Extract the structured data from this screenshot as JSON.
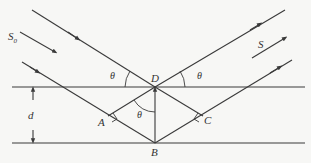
{
  "diagram": {
    "labels": {
      "incident_beam": "S",
      "incident_sub": "0",
      "reflected_beam": "S",
      "point_D": "D",
      "point_A": "A",
      "point_B": "B",
      "point_C": "C",
      "spacing": "d",
      "angle_left": "θ",
      "angle_right": "θ",
      "angle_inner": "θ"
    },
    "colors": {
      "line": "#3a3a3a",
      "background": "#f7f7f5"
    },
    "elements": [
      "upper crystal plane",
      "lower crystal plane",
      "incident ray to D",
      "reflected ray from D",
      "incident ray to B via A",
      "reflected ray from B via C",
      "normal DB",
      "perpendicular DA",
      "perpendicular DC",
      "plane spacing arrow d"
    ]
  }
}
